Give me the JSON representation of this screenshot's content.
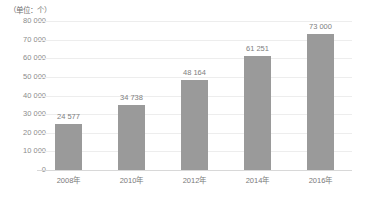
{
  "chart_data": {
    "type": "bar",
    "title": "",
    "subtitle": "",
    "unit_label": "（单位：个）",
    "xlabel": "",
    "ylabel": "",
    "categories": [
      "2008年",
      "2010年",
      "2012年",
      "2014年",
      "2016年"
    ],
    "values": [
      24577,
      34738,
      48164,
      61251,
      73000
    ],
    "value_labels": [
      "24 577",
      "34 738",
      "48 164",
      "61 251",
      "73 000"
    ],
    "ylim": [
      0,
      80000
    ],
    "ytick_values": [
      80000,
      70000,
      60000,
      50000,
      40000,
      30000,
      20000,
      10000,
      0
    ],
    "ytick_labels": [
      "80 000",
      "70 000",
      "60 000",
      "50 000",
      "40 000",
      "30 000",
      "20 000",
      "10 000",
      "0"
    ],
    "grid": true,
    "grid_axis": "y",
    "legend": false,
    "legend_position": "none",
    "bar_color": "#9a9a9a",
    "grid_color": "#ededed",
    "axis_color": "#d8d8d8",
    "text_color": "#808080",
    "background_color": "#ffffff"
  }
}
